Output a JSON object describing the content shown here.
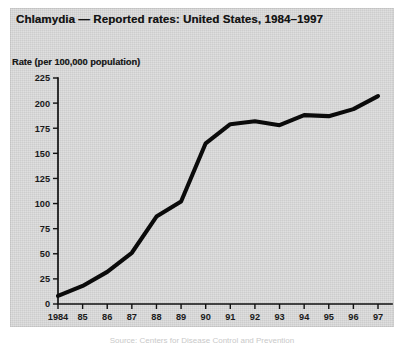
{
  "figure": {
    "title": "Chlamydia — Reported rates: United States, 1984–1997",
    "y_axis_label": "Rate (per 100,000 population)",
    "bottom_caption": "Source: Centers for Disease Control and Prevention"
  },
  "chart_data": {
    "type": "line",
    "title": "Chlamydia — Reported rates: United States, 1984–1997",
    "xlabel": "",
    "ylabel": "Rate (per 100,000 population)",
    "ylim": [
      0,
      225
    ],
    "grid": false,
    "legend": "none",
    "categories": [
      "1984",
      "85",
      "86",
      "87",
      "88",
      "89",
      "90",
      "91",
      "92",
      "93",
      "94",
      "95",
      "96",
      "97"
    ],
    "x_tick_labels": [
      "1984",
      "85",
      "86",
      "87",
      "88",
      "89",
      "90",
      "91",
      "92",
      "93",
      "94",
      "95",
      "96",
      "97"
    ],
    "y_tick_labels": [
      "0",
      "25",
      "50",
      "75",
      "100",
      "125",
      "150",
      "175",
      "200",
      "225"
    ],
    "y_ticks": [
      0,
      25,
      50,
      75,
      100,
      125,
      150,
      175,
      200,
      225
    ],
    "series": [
      {
        "name": "Chlamydia reported rate",
        "values": [
          8,
          18,
          32,
          51,
          87,
          102,
          160,
          179,
          182,
          178,
          188,
          187,
          194,
          207
        ]
      }
    ]
  }
}
